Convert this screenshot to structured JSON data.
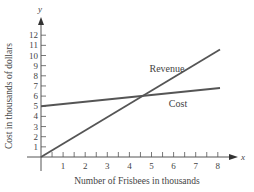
{
  "chart_data": {
    "type": "line",
    "title": "",
    "xlabel": "Number of Frisbees in thousands",
    "ylabel": "Cost in thousands of dollars",
    "x_axis_letter": "x",
    "y_axis_letter": "y",
    "xlim": [
      0,
      8.5
    ],
    "ylim": [
      0,
      12.5
    ],
    "x_ticks": [
      1,
      2,
      3,
      4,
      5,
      6,
      7,
      8
    ],
    "x_minor_step": 0.5,
    "y_ticks": [
      1,
      2,
      3,
      4,
      5,
      6,
      7,
      8,
      9,
      10,
      11,
      12
    ],
    "grid": false,
    "legend": "inline labels",
    "series": [
      {
        "name": "Revenue",
        "x": [
          0,
          8.1
        ],
        "y": [
          0,
          10.6
        ],
        "label_pos": [
          5.7,
          8.4
        ]
      },
      {
        "name": "Cost",
        "x": [
          0,
          8.1
        ],
        "y": [
          5,
          6.8
        ],
        "label_pos": [
          6.2,
          4.9
        ]
      }
    ],
    "intersection": {
      "x": 4.6,
      "y": 6.0
    }
  }
}
